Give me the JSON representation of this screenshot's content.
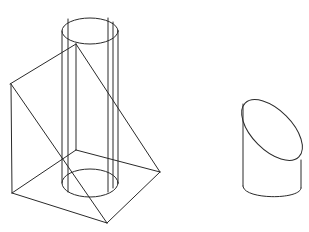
{
  "diagram": {
    "type": "wireframe-3d-illustration",
    "background": "#ffffff",
    "line_color": "#2a2a2a",
    "objects": [
      {
        "id": "cylinder-wedge-assembly",
        "description": "Vertical cylinder passing through a triangular prism wedge (wireframe)",
        "parts": [
          "cylinder",
          "wedge-prism"
        ]
      },
      {
        "id": "truncated-cylinder",
        "description": "Cylinder cut by an oblique plane, showing elliptical top face"
      }
    ]
  }
}
